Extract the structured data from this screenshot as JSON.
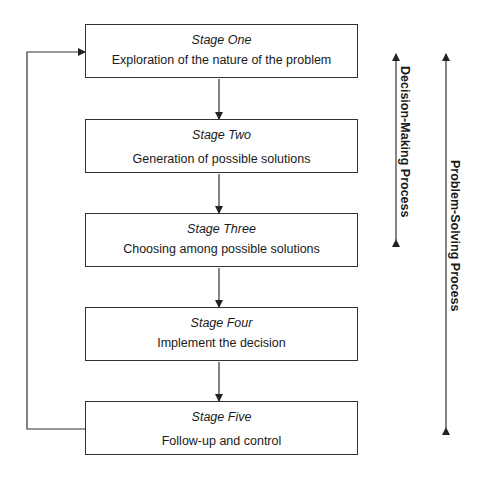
{
  "stages": [
    {
      "title": "Stage One",
      "description": "Exploration of the nature of the problem"
    },
    {
      "title": "Stage Two",
      "description": "Generation of possible solutions"
    },
    {
      "title": "Stage Three",
      "description": "Choosing among possible solutions"
    },
    {
      "title": "Stage Four",
      "description": "Implement the decision"
    },
    {
      "title": "Stage Five",
      "description": "Follow-up and control"
    }
  ],
  "processes": {
    "decision_making": "Decision-Making Process",
    "problem_solving": "Problem-Solving Process"
  },
  "colors": {
    "line": "#333333",
    "text": "#1a1a1a",
    "background": "#ffffff"
  }
}
